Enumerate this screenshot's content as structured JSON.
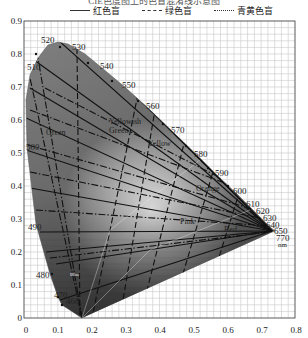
{
  "title": "CIE色度图上的色盲混淆线示意图",
  "legend": [
    {
      "label": "红色盲",
      "style": "solid"
    },
    {
      "label": "绿色盲",
      "style": "dashed"
    },
    {
      "label": "青黄色盲",
      "style": "dash-dot"
    }
  ],
  "axes": {
    "x_ticks": [
      "0",
      "0.1",
      "0.2",
      "0.3",
      "0.4",
      "0.5",
      "0.6",
      "0.7",
      "0.8"
    ],
    "y_ticks": [
      "0",
      "0.1",
      "0.2",
      "0.3",
      "0.4",
      "0.5",
      "0.6",
      "0.7",
      "0.8",
      "0.9"
    ]
  },
  "wavelengths": [
    "460",
    "470",
    "480",
    "490",
    "500",
    "510",
    "520",
    "530",
    "540",
    "550",
    "560",
    "570",
    "580",
    "590",
    "600",
    "610",
    "620",
    "630",
    "640",
    "650",
    "770",
    "nm"
  ],
  "regions": [
    "Green",
    "Yellowish Green",
    "Yellow",
    "Orange",
    "Pink",
    "Red",
    "Blue",
    "Purple"
  ],
  "chart_data": {
    "type": "scatter",
    "xlabel": "x",
    "ylabel": "y",
    "xlim": [
      0,
      0.8
    ],
    "ylim": [
      0,
      0.9
    ],
    "grid": true,
    "legend": [
      "红色盲 (protan, solid)",
      "绿色盲 (deutan, dashed)",
      "青黄色盲 (tritan, dash-dot)"
    ],
    "spectral_locus": [
      {
        "nm": 460,
        "x": 0.144,
        "y": 0.03
      },
      {
        "nm": 470,
        "x": 0.124,
        "y": 0.058
      },
      {
        "nm": 480,
        "x": 0.091,
        "y": 0.133
      },
      {
        "nm": 490,
        "x": 0.045,
        "y": 0.295
      },
      {
        "nm": 500,
        "x": 0.008,
        "y": 0.538
      },
      {
        "nm": 510,
        "x": 0.014,
        "y": 0.75
      },
      {
        "nm": 520,
        "x": 0.074,
        "y": 0.834
      },
      {
        "nm": 530,
        "x": 0.155,
        "y": 0.806
      },
      {
        "nm": 540,
        "x": 0.23,
        "y": 0.754
      },
      {
        "nm": 550,
        "x": 0.302,
        "y": 0.692
      },
      {
        "nm": 560,
        "x": 0.373,
        "y": 0.624
      },
      {
        "nm": 570,
        "x": 0.444,
        "y": 0.555
      },
      {
        "nm": 580,
        "x": 0.512,
        "y": 0.487
      },
      {
        "nm": 590,
        "x": 0.575,
        "y": 0.424
      },
      {
        "nm": 600,
        "x": 0.627,
        "y": 0.372
      },
      {
        "nm": 610,
        "x": 0.666,
        "y": 0.334
      },
      {
        "nm": 620,
        "x": 0.691,
        "y": 0.308
      },
      {
        "nm": 630,
        "x": 0.708,
        "y": 0.292
      },
      {
        "nm": 640,
        "x": 0.719,
        "y": 0.281
      },
      {
        "nm": 650,
        "x": 0.726,
        "y": 0.274
      },
      {
        "nm": 770,
        "x": 0.735,
        "y": 0.265
      }
    ],
    "confusion_points": {
      "protan": {
        "x": 0.747,
        "y": 0.253
      },
      "deutan": {
        "x": 1.08,
        "y": -0.08
      },
      "tritan": {
        "x": 0.171,
        "y": 0.0
      }
    }
  }
}
